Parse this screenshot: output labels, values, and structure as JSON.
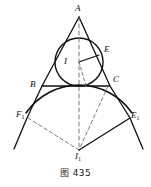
{
  "figure": {
    "caption": "图 435",
    "background_color": "#ffffff",
    "stroke_color": "#101010",
    "dashed_color": "#6b6b6b",
    "width": 151,
    "height": 187
  },
  "labels": {
    "apex": "A",
    "tangent_right_upper": "E",
    "incenter": "I",
    "vertex_left": "B",
    "vertex_right": "C",
    "excircle_left": "F",
    "excircle_left_sub": "1",
    "excircle_right": "E",
    "excircle_right_sub": "1",
    "excenter": "I",
    "excenter_sub": "1"
  },
  "geometry": {
    "points": {
      "A": [
        79,
        17
      ],
      "B": [
        42,
        86
      ],
      "C": [
        110,
        86
      ],
      "I": [
        72,
        64
      ],
      "I1": [
        79,
        150
      ],
      "F1": [
        27,
        118
      ],
      "E1": [
        130,
        118
      ],
      "E": [
        101,
        52
      ],
      "T_top": [
        79,
        86
      ],
      "left_ray_end": [
        14,
        148
      ],
      "right_ray_end": [
        143,
        148
      ]
    },
    "incircle": {
      "cx": 79,
      "cy": 62,
      "r": 24
    },
    "excircle_arc": {
      "cx": 79,
      "cy": 150,
      "r": 65
    }
  }
}
